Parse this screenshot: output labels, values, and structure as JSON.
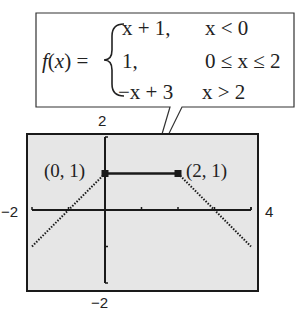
{
  "chart_data": {
    "type": "line",
    "title": "",
    "xlabel": "",
    "ylabel": "",
    "xlim": [
      -2,
      4
    ],
    "ylim": [
      -2,
      2
    ],
    "grid": false,
    "x_tick_labels": {
      "min": "−2",
      "max": "4"
    },
    "y_tick_labels": {
      "min": "−2",
      "max": "2"
    },
    "x_ticks": [
      -1,
      0,
      1,
      2,
      3,
      4
    ],
    "y_ticks": [
      -1,
      0,
      1
    ],
    "series": [
      {
        "name": "x + 1 (x < 0)",
        "style": "dotted",
        "points": [
          [
            -2,
            -1
          ],
          [
            0,
            1
          ]
        ]
      },
      {
        "name": "1 (0 ≤ x ≤ 2)",
        "style": "solid",
        "points": [
          [
            0,
            1
          ],
          [
            2,
            1
          ]
        ]
      },
      {
        "name": "-x + 3 (x > 2)",
        "style": "dotted",
        "points": [
          [
            2,
            1
          ],
          [
            4,
            -1
          ]
        ]
      }
    ],
    "markers": [
      {
        "x": 0,
        "y": 1,
        "label": "(0, 1)"
      },
      {
        "x": 2,
        "y": 1,
        "label": "(2, 1)"
      }
    ],
    "annotation": {
      "function_name": "f(x) =",
      "cases": [
        {
          "expr": "x + 1,",
          "cond": "x < 0"
        },
        {
          "expr": "1,",
          "cond": "0 ≤ x ≤ 2"
        },
        {
          "expr": "−x + 3",
          "cond": "x > 2"
        }
      ]
    }
  },
  "colors": {
    "screen_bg": "#e6e6e6",
    "ink": "#1a1a1a"
  }
}
